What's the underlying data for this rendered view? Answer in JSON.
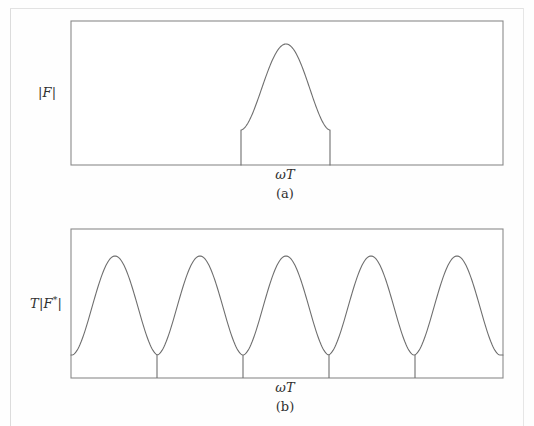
{
  "figure": {
    "type": "two-panel-line-plot",
    "background_color": "#fefefe",
    "line_color": "#6b6b6b",
    "frame_color": "#808080",
    "text_color": "#2f2f2f"
  },
  "panel_a": {
    "id": "a",
    "caption": "(a)",
    "ylabel_parts": {
      "bar_left": "|",
      "symbol": "F",
      "bar_right": "|"
    },
    "ylabel_text": "|F|",
    "xlabel_parts": {
      "omega": "ω",
      "T": "T"
    },
    "xlabel_text": "ωT",
    "frame": {
      "x": 71,
      "y": 21,
      "width": 432,
      "height": 144
    }
  },
  "panel_b": {
    "id": "b",
    "caption": "(b)",
    "ylabel_parts": {
      "T": "T",
      "bar_left": "|",
      "symbol": "F",
      "star": "*",
      "bar_right": "|"
    },
    "ylabel_text": "T|F*|",
    "xlabel_parts": {
      "omega": "ω",
      "T": "T"
    },
    "xlabel_text": "ωT",
    "frame": {
      "x": 71,
      "y": 229,
      "width": 432,
      "height": 149
    }
  },
  "chart_data": [
    {
      "type": "line",
      "id": "panel-a",
      "title": "(a)",
      "xlabel": "ωT",
      "ylabel": "|F|",
      "grid": false,
      "legend": null,
      "xlim": [
        0,
        432
      ],
      "ylim": [
        0,
        144
      ],
      "description": "Single bell-shaped continuous Fourier magnitude lobe centered in the frame, rising from a flat shelf at about 24 percent of full height and peaking near the middle-right of the axis.",
      "series": [
        {
          "name": "|F| continuous transform magnitude",
          "x": [
            170,
            174,
            179,
            185,
            192,
            200,
            209,
            218,
            227,
            236,
            245,
            254,
            262,
            269,
            275,
            281,
            287,
            293,
            299,
            206,
            214
          ],
          "points_px": [
            [
              241,
              165
            ],
            [
              241,
              131
            ],
            [
              243,
              128
            ],
            [
              247,
              122
            ],
            [
              252,
              113
            ],
            [
              258,
              103
            ],
            [
              264,
              92
            ],
            [
              270,
              80
            ],
            [
              276,
              66
            ],
            [
              281,
              55
            ],
            [
              286,
              45
            ],
            [
              291,
              50
            ],
            [
              296,
              60
            ],
            [
              301,
              73
            ],
            [
              306,
              86
            ],
            [
              311,
              99
            ],
            [
              316,
              110
            ],
            [
              321,
              120
            ],
            [
              326,
              127
            ],
            [
              330,
              130
            ],
            [
              330,
              165
            ]
          ],
          "peak_px": [
            286,
            44
          ],
          "foot_left_px": [
            241,
            130
          ],
          "foot_right_px": [
            330,
            130
          ],
          "baseline_px_y": 165
        }
      ]
    },
    {
      "type": "line",
      "id": "panel-b",
      "title": "(b)",
      "xlabel": "ωT",
      "ylabel": "T|F*|",
      "grid": false,
      "legend": null,
      "xlim": [
        0,
        432
      ],
      "ylim": [
        0,
        149
      ],
      "description": "Periodic replication of the lobe in panel (a): five repeated bell-shaped humps of equal height, each separated by a cusp-like minimum that drops vertically to the baseline. Period is about 86 pixels.",
      "series": [
        {
          "name": "T|F*| sampled transform magnitude",
          "period_px": 86,
          "peaks_px_x": [
            115,
            200,
            286,
            371,
            457
          ],
          "peak_px_y": 256,
          "minima_px_x": [
            71,
            157,
            243,
            329,
            415,
            503
          ],
          "minimum_px_y": 355,
          "baseline_px_y": 378,
          "tick_drops": [
            {
              "x": 157,
              "y_top": 355,
              "y_bottom": 378
            },
            {
              "x": 243,
              "y_top": 355,
              "y_bottom": 378
            },
            {
              "x": 329,
              "y_top": 355,
              "y_bottom": 378
            },
            {
              "x": 415,
              "y_top": 355,
              "y_bottom": 378
            }
          ]
        }
      ]
    }
  ]
}
